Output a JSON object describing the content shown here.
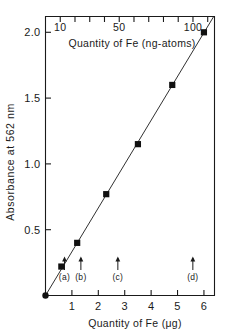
{
  "chart_data": {
    "type": "scatter",
    "title": "",
    "xlabel": "Quantity of Fe (μg)",
    "ylabel": "Absorbance at 562 nm",
    "x2label": "Quantity of Fe (ng-atoms)",
    "xlim": [
      0,
      6.4
    ],
    "ylim": [
      0,
      2.12
    ],
    "x2lim": [
      0,
      114.6
    ],
    "grid": false,
    "legend": null,
    "xticks": [
      1,
      2,
      3,
      4,
      5,
      6
    ],
    "xticklabels": [
      "1",
      "2",
      "3",
      "4",
      "5",
      "6"
    ],
    "yticks": [
      0.5,
      1.0,
      1.5,
      2.0
    ],
    "yticklabels": [
      "0.5",
      "1.0",
      "1.5",
      "2.0"
    ],
    "x2ticks": [
      10,
      20,
      30,
      40,
      50,
      60,
      70,
      80,
      90,
      100,
      110
    ],
    "x2ticklabels": [
      "10",
      "",
      "",
      "",
      "50",
      "",
      "",
      "",
      "",
      "100",
      ""
    ],
    "x2labeled_ticks": [
      {
        "value": 10,
        "label": "10"
      },
      {
        "value": 50,
        "label": "50"
      },
      {
        "value": 100,
        "label": "100"
      }
    ],
    "series": [
      {
        "name": "Fe calibration",
        "marker": "square",
        "color": "#111111",
        "line": true,
        "x": [
          0.0,
          0.6,
          1.2,
          2.3,
          3.5,
          4.8,
          6.0
        ],
        "y": [
          0.0,
          0.22,
          0.4,
          0.77,
          1.15,
          1.6,
          2.0
        ]
      }
    ],
    "annotations": [
      {
        "label": "(a)",
        "x": 0.72,
        "marker": "up-arrow"
      },
      {
        "label": "(b)",
        "x": 1.34,
        "marker": "up-arrow"
      },
      {
        "label": "(c)",
        "x": 2.74,
        "marker": "up-arrow"
      },
      {
        "label": "(d)",
        "x": 5.58,
        "marker": "up-arrow"
      }
    ]
  },
  "figure": {
    "background_color": "#ffffff",
    "ink_color": "#1a1a1a"
  }
}
